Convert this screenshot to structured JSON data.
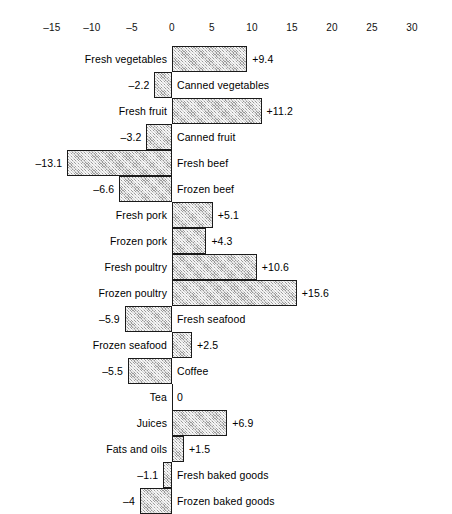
{
  "chart_data": {
    "type": "bar",
    "orientation": "horizontal",
    "title": "",
    "subtitle": "",
    "xlabel": "",
    "ylabel": "",
    "grid": false,
    "legend": null,
    "axis": {
      "position": "top",
      "xlim": [
        -17.5,
        35
      ],
      "tick_labels": [
        "–15",
        "–10",
        "–5",
        "0",
        "5",
        "10",
        "15",
        "20",
        "25",
        "30"
      ],
      "tick_values": [
        -15,
        -10,
        -5,
        0,
        5,
        10,
        15,
        20,
        25,
        30
      ],
      "zero_line": 0
    },
    "categories": [
      "Fresh vegetables",
      "Canned vegetables",
      "Fresh fruit",
      "Canned fruit",
      "Fresh beef",
      "Frozen beef",
      "Fresh pork",
      "Frozen pork",
      "Fresh poultry",
      "Frozen poultry",
      "Fresh seafood",
      "Frozen seafood",
      "Coffee",
      "Tea",
      "Juices",
      "Fats and oils",
      "Fresh baked goods",
      "Frozen baked goods"
    ],
    "values": [
      9.4,
      -2.2,
      11.2,
      -3.2,
      -13.1,
      -6.6,
      5.1,
      4.3,
      10.6,
      15.6,
      -5.9,
      2.5,
      -5.5,
      0,
      6.9,
      1.5,
      -1.1,
      -4
    ],
    "value_labels": [
      "+9.4",
      "–2.2",
      "+11.2",
      "–3.2",
      "–13.1",
      "–6.6",
      "+5.1",
      "+4.3",
      "+10.6",
      "+15.6",
      "–5.9",
      "+2.5",
      "–5.5",
      "0",
      "+6.9",
      "+1.5",
      "–1.1",
      "–4"
    ],
    "colors": {
      "bar_fill": "#9a9a9a",
      "bar_edge": "#1a1a1a",
      "text": "#000000",
      "background": "#ffffff"
    }
  }
}
